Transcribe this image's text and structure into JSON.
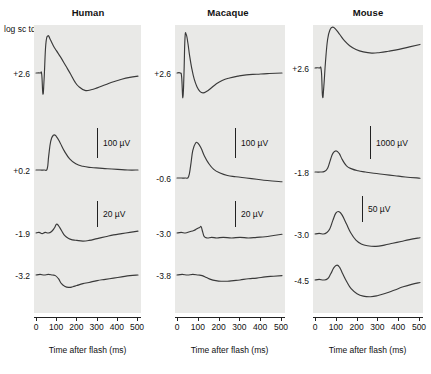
{
  "figure": {
    "y_axis_units_label": "log sc td. s",
    "x_axis_title": "Time after flash (ms)",
    "x_ticks": [
      "0",
      "100",
      "200",
      "300",
      "400",
      "500"
    ],
    "panel_bg_color": "#e9e9e7",
    "trace_color": "#3a3a3a"
  },
  "panels": [
    {
      "title": "Human",
      "intensity_labels": [
        "+2.6",
        "+0.2",
        "-1.9",
        "-3.2"
      ],
      "scale_bars": [
        {
          "label": "100 µV"
        },
        {
          "label": "20 µV"
        }
      ]
    },
    {
      "title": "Macaque",
      "intensity_labels": [
        "+2.6",
        "-0.6",
        "-3.0",
        "-3.8"
      ],
      "scale_bars": [
        {
          "label": "100 µV"
        },
        {
          "label": "20 µV"
        }
      ]
    },
    {
      "title": "Mouse",
      "intensity_labels": [
        "+2.6",
        "-1.8",
        "-3.0",
        "-4.5"
      ],
      "scale_bars": [
        {
          "label": "1000 µV"
        },
        {
          "label": "50 µV"
        }
      ]
    }
  ],
  "chart_data": {
    "type": "line",
    "xlabel": "Time after flash (ms)",
    "ylabel": "log sc td. s",
    "xlim": [
      0,
      500
    ],
    "grid": false,
    "legend": "none",
    "panels": [
      {
        "name": "Human",
        "traces": [
          {
            "intensity": "+2.6",
            "amplitude_scale": "100 µV",
            "x": [
              0,
              20,
              28,
              34,
              40,
              48,
              58,
              70,
              85,
              100,
              120,
              145,
              170,
              190,
              210,
              240,
              270,
              300,
              340,
              380,
              420,
              460,
              500
            ],
            "y": [
              0,
              0,
              -2,
              -34,
              -8,
              46,
              60,
              54,
              44,
              36,
              26,
              12,
              -2,
              -14,
              -22,
              -28,
              -27,
              -24,
              -19,
              -14,
              -10,
              -7,
              -5
            ]
          },
          {
            "intensity": "+0.2",
            "amplitude_scale": "100 µV",
            "x": [
              0,
              20,
              40,
              55,
              62,
              72,
              85,
              100,
              118,
              140,
              165,
              195,
              230,
              270,
              310,
              350,
              400,
              450,
              500
            ],
            "y": [
              0,
              0,
              0,
              2,
              22,
              46,
              56,
              54,
              44,
              30,
              18,
              10,
              6,
              4,
              3,
              2,
              1,
              0,
              0
            ]
          },
          {
            "intensity": "-1.9",
            "amplitude_scale": "20 µV",
            "x": [
              0,
              15,
              30,
              45,
              60,
              75,
              90,
              100,
              110,
              125,
              140,
              160,
              180,
              200,
              230,
              260,
              300,
              340,
              380,
              420,
              460,
              500
            ],
            "y": [
              0,
              1,
              -1,
              1,
              0,
              2,
              8,
              14,
              12,
              4,
              -4,
              -9,
              -11,
              -12,
              -13,
              -12,
              -9,
              -6,
              -3,
              -1,
              1,
              3
            ]
          },
          {
            "intensity": "-3.2",
            "amplitude_scale": "20 µV",
            "x": [
              0,
              20,
              40,
              60,
              80,
              95,
              110,
              125,
              140,
              160,
              180,
              200,
              230,
              260,
              300,
              340,
              380,
              420,
              460,
              500
            ],
            "y": [
              0,
              1,
              0,
              1,
              0,
              -1,
              -6,
              -14,
              -18,
              -20,
              -19,
              -17,
              -14,
              -12,
              -9,
              -7,
              -5,
              -3,
              -1,
              0
            ]
          }
        ]
      },
      {
        "name": "Macaque",
        "traces": [
          {
            "intensity": "+2.6",
            "amplitude_scale": "100 µV",
            "x": [
              0,
              15,
              22,
              28,
              33,
              38,
              44,
              52,
              60,
              70,
              82,
              95,
              110,
              125,
              140,
              160,
              185,
              215,
              250,
              290,
              330,
              380,
              430,
              500
            ],
            "y": [
              0,
              0,
              -6,
              -40,
              -4,
              56,
              62,
              48,
              28,
              8,
              -10,
              -22,
              -30,
              -32,
              -30,
              -25,
              -18,
              -12,
              -8,
              -5,
              -3,
              -2,
              -1,
              0
            ]
          },
          {
            "intensity": "-0.6",
            "amplitude_scale": "100 µV",
            "x": [
              0,
              20,
              40,
              55,
              65,
              75,
              88,
              100,
              115,
              130,
              150,
              175,
              205,
              240,
              280,
              330,
              380,
              430,
              500
            ],
            "y": [
              0,
              0,
              0,
              2,
              20,
              44,
              56,
              56,
              48,
              36,
              24,
              14,
              8,
              4,
              2,
              0,
              -2,
              -4,
              -6
            ]
          },
          {
            "intensity": "-3.0",
            "amplitude_scale": "20 µV",
            "x": [
              0,
              20,
              40,
              60,
              80,
              95,
              108,
              115,
              122,
              130,
              145,
              165,
              190,
              220,
              260,
              300,
              340,
              380,
              420,
              460,
              500
            ],
            "y": [
              0,
              1,
              0,
              2,
              4,
              7,
              9,
              10,
              2,
              -6,
              -8,
              -7,
              -8,
              -7,
              -8,
              -7,
              -8,
              -7,
              -6,
              -4,
              -2
            ]
          },
          {
            "intensity": "-3.8",
            "amplitude_scale": "20 µV",
            "x": [
              0,
              25,
              50,
              75,
              100,
              120,
              140,
              160,
              185,
              210,
              240,
              270,
              300,
              340,
              380,
              420,
              460,
              500
            ],
            "y": [
              0,
              1,
              0,
              1,
              0,
              -1,
              -4,
              -7,
              -9,
              -10,
              -10,
              -9,
              -8,
              -6,
              -5,
              -3,
              -2,
              -1
            ]
          }
        ]
      },
      {
        "name": "Mouse",
        "traces": [
          {
            "intensity": "+2.6",
            "amplitude_scale": "1000 µV",
            "x": [
              0,
              20,
              30,
              36,
              42,
              50,
              60,
              72,
              85,
              100,
              118,
              140,
              165,
              195,
              230,
              270,
              310,
              350,
              400,
              450,
              500
            ],
            "y": [
              0,
              0,
              -4,
              -46,
              -30,
              10,
              46,
              62,
              66,
              62,
              54,
              44,
              36,
              30,
              26,
              24,
              25,
              27,
              30,
              34,
              38
            ]
          },
          {
            "intensity": "-1.8",
            "amplitude_scale": "1000 µV",
            "x": [
              0,
              25,
              45,
              60,
              72,
              85,
              100,
              115,
              130,
              150,
              175,
              205,
              240,
              280,
              330,
              380,
              430,
              500
            ],
            "y": [
              0,
              0,
              1,
              6,
              18,
              30,
              34,
              30,
              20,
              10,
              5,
              2,
              0,
              -2,
              -4,
              -6,
              -8,
              -10
            ]
          },
          {
            "intensity": "-3.0",
            "amplitude_scale": "50 µV",
            "x": [
              0,
              20,
              40,
              55,
              70,
              85,
              100,
              115,
              130,
              150,
              170,
              195,
              220,
              250,
              290,
              330,
              370,
              410,
              450,
              500
            ],
            "y": [
              0,
              1,
              0,
              2,
              8,
              22,
              34,
              36,
              30,
              16,
              2,
              -10,
              -16,
              -19,
              -20,
              -18,
              -15,
              -12,
              -9,
              -6
            ]
          },
          {
            "intensity": "-4.5",
            "amplitude_scale": "50 µV",
            "x": [
              0,
              20,
              40,
              60,
              75,
              90,
              105,
              118,
              132,
              150,
              172,
              200,
              230,
              265,
              300,
              340,
              380,
              420,
              460,
              500
            ],
            "y": [
              0,
              1,
              0,
              2,
              10,
              20,
              24,
              20,
              10,
              -2,
              -14,
              -22,
              -26,
              -27,
              -25,
              -21,
              -16,
              -11,
              -7,
              -4
            ]
          }
        ]
      }
    ]
  }
}
